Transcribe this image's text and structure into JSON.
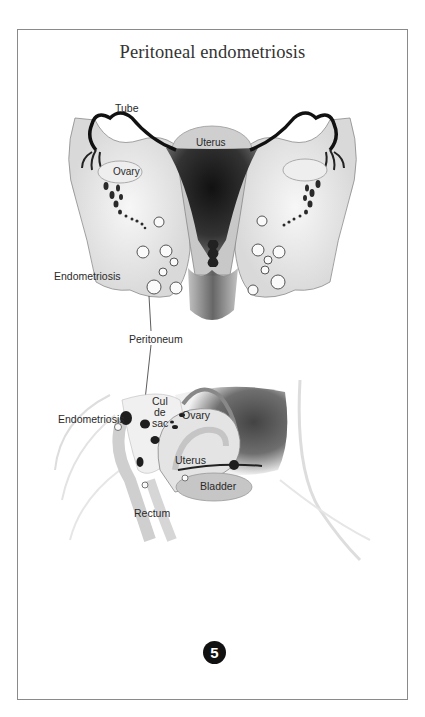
{
  "page": {
    "corner_mark": "",
    "title": "Peritoneal endometriosis",
    "figure_number": "5"
  },
  "upper_figure": {
    "labels": {
      "tube": "Tube",
      "uterus": "Uterus",
      "ovary": "Ovary",
      "endometriosis": "Endometriosis",
      "peritoneum": "Peritoneum"
    }
  },
  "lower_figure": {
    "labels": {
      "cul_de_sac_line1": "Cul",
      "cul_de_sac_line2": "de",
      "cul_de_sac_line3": "sac",
      "endometriosis": "Endometriosis",
      "ovary": "Ovary",
      "uterus": "Uterus",
      "bladder": "Bladder",
      "rectum": "Rectum"
    }
  },
  "colors": {
    "frame_border": "#8a8a8a",
    "tissue_light": "#e6e6e6",
    "tissue_mid": "#bdbdbd",
    "tissue_dark": "#1e1e1e",
    "badge_bg": "#111111"
  }
}
